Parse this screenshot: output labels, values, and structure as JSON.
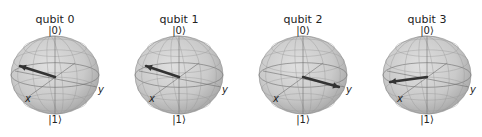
{
  "chart_data": {
    "type": "bloch_multivector",
    "title": "",
    "sphere_color": "#bdbdbd",
    "arrow_color": "#333333",
    "spheres": [
      {
        "title": "qubit 0",
        "top_label": "|0⟩",
        "bottom_label": "|1⟩",
        "x_label": "x",
        "y_label": "y",
        "center": [
          55,
          75
        ],
        "radius": 42,
        "arrow_tip": [
          20,
          66
        ]
      },
      {
        "title": "qubit 1",
        "top_label": "|0⟩",
        "bottom_label": "|1⟩",
        "x_label": "x",
        "y_label": "y",
        "center": [
          179,
          75
        ],
        "radius": 42,
        "arrow_tip": [
          146,
          66
        ]
      },
      {
        "title": "qubit 2",
        "top_label": "|0⟩",
        "bottom_label": "|1⟩",
        "x_label": "x",
        "y_label": "y",
        "center": [
          303,
          75
        ],
        "radius": 42,
        "arrow_tip": [
          339,
          87
        ]
      },
      {
        "title": "qubit 3",
        "top_label": "|0⟩",
        "bottom_label": "|1⟩",
        "x_label": "x",
        "y_label": "y",
        "center": [
          427,
          75
        ],
        "radius": 42,
        "arrow_tip": [
          390,
          82
        ]
      }
    ]
  }
}
